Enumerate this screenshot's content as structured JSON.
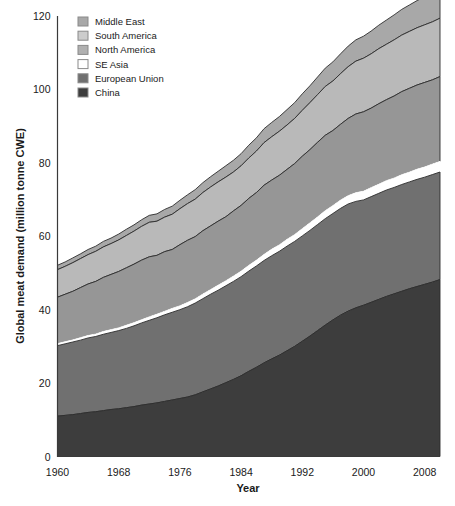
{
  "chart_data": {
    "type": "area",
    "stacked": true,
    "title": "",
    "xlabel": "Year",
    "ylabel": "Global meat demand (million tonne CWE)",
    "xlim": [
      1960,
      2010
    ],
    "ylim": [
      0,
      120
    ],
    "xticks": [
      1960,
      1968,
      1976,
      1984,
      1992,
      2000,
      2008
    ],
    "yticks": [
      0,
      20,
      40,
      60,
      80,
      100,
      120
    ],
    "grid": false,
    "legend_position": "top-left",
    "x": [
      1960,
      1961,
      1962,
      1963,
      1964,
      1965,
      1966,
      1967,
      1968,
      1969,
      1970,
      1971,
      1972,
      1973,
      1974,
      1975,
      1976,
      1977,
      1978,
      1979,
      1980,
      1981,
      1982,
      1983,
      1984,
      1985,
      1986,
      1987,
      1988,
      1989,
      1990,
      1991,
      1992,
      1993,
      1994,
      1995,
      1996,
      1997,
      1998,
      1999,
      2000,
      2001,
      2002,
      2003,
      2004,
      2005,
      2006,
      2007,
      2008,
      2009,
      2010
    ],
    "series": [
      {
        "name": "China",
        "color": "#3d3d3d",
        "values": [
          11.0,
          11.2,
          11.4,
          11.7,
          12.0,
          12.2,
          12.5,
          12.8,
          13.0,
          13.3,
          13.6,
          14.0,
          14.3,
          14.6,
          15.0,
          15.4,
          15.8,
          16.2,
          16.8,
          17.6,
          18.4,
          19.2,
          20.1,
          21.0,
          22.0,
          23.2,
          24.3,
          25.5,
          26.6,
          27.6,
          28.8,
          30.0,
          31.4,
          32.8,
          34.3,
          35.8,
          37.2,
          38.5,
          39.6,
          40.5,
          41.2,
          42.0,
          42.8,
          43.6,
          44.3,
          45.0,
          45.7,
          46.3,
          46.9,
          47.5,
          48.2
        ]
      },
      {
        "name": "European Union",
        "color": "#707070",
        "values": [
          19.2,
          19.5,
          19.8,
          20.0,
          20.3,
          20.5,
          20.8,
          21.0,
          21.3,
          21.6,
          22.0,
          22.4,
          22.8,
          23.2,
          23.6,
          23.9,
          24.2,
          24.6,
          25.0,
          25.4,
          25.8,
          26.1,
          26.4,
          26.7,
          27.0,
          27.3,
          27.6,
          27.9,
          28.1,
          28.3,
          28.5,
          28.6,
          28.7,
          28.8,
          28.9,
          29.0,
          29.0,
          29.1,
          29.2,
          29.0,
          28.7,
          28.8,
          28.9,
          29.0,
          29.0,
          29.1,
          29.1,
          29.2,
          29.2,
          29.3,
          29.3
        ]
      },
      {
        "name": "SE Asia",
        "color": "#ffffff",
        "values": [
          0.6,
          0.6,
          0.6,
          0.7,
          0.7,
          0.7,
          0.8,
          0.8,
          0.8,
          0.9,
          0.9,
          0.9,
          1.0,
          1.0,
          1.0,
          1.1,
          1.1,
          1.2,
          1.2,
          1.3,
          1.3,
          1.4,
          1.4,
          1.5,
          1.5,
          1.6,
          1.6,
          1.7,
          1.8,
          1.8,
          1.9,
          1.9,
          2.0,
          2.1,
          2.1,
          2.2,
          2.2,
          2.3,
          2.3,
          2.4,
          2.4,
          2.5,
          2.5,
          2.6,
          2.6,
          2.7,
          2.7,
          2.8,
          2.8,
          2.9,
          2.9
        ]
      },
      {
        "name": "North America",
        "color": "#969696",
        "values": [
          12.6,
          12.9,
          13.2,
          13.6,
          14.0,
          14.3,
          14.7,
          15.0,
          15.3,
          15.6,
          15.9,
          16.2,
          16.3,
          16.0,
          16.2,
          16.0,
          16.6,
          16.9,
          16.9,
          17.2,
          17.3,
          17.4,
          17.4,
          17.7,
          17.9,
          18.2,
          18.4,
          18.8,
          18.8,
          18.9,
          19.0,
          19.3,
          19.7,
          19.9,
          20.3,
          20.5,
          20.4,
          20.6,
          21.0,
          21.4,
          21.6,
          21.6,
          21.9,
          22.0,
          22.3,
          22.6,
          22.8,
          22.9,
          23.0,
          22.9,
          23.1
        ]
      },
      {
        "name": "South America",
        "color": "#b9b9b9",
        "values": [
          7.5,
          7.6,
          7.8,
          7.9,
          8.0,
          8.2,
          8.3,
          8.4,
          8.6,
          8.8,
          9.0,
          9.2,
          9.4,
          9.3,
          9.4,
          9.6,
          9.8,
          10.0,
          10.2,
          10.4,
          10.6,
          10.7,
          10.8,
          10.6,
          10.8,
          11.0,
          11.3,
          11.6,
          11.8,
          12.0,
          12.1,
          12.3,
          12.5,
          12.8,
          13.0,
          13.3,
          13.5,
          13.8,
          14.1,
          14.4,
          14.6,
          14.8,
          15.0,
          15.1,
          15.3,
          15.4,
          15.5,
          15.6,
          15.7,
          15.8,
          15.9
        ]
      },
      {
        "name": "Middle East",
        "color": "#a8a8a8",
        "values": [
          1.2,
          1.2,
          1.3,
          1.3,
          1.4,
          1.4,
          1.5,
          1.5,
          1.6,
          1.7,
          1.7,
          1.8,
          1.9,
          2.0,
          2.1,
          2.2,
          2.3,
          2.4,
          2.6,
          2.7,
          2.8,
          2.9,
          3.1,
          3.2,
          3.3,
          3.5,
          3.6,
          3.8,
          3.9,
          4.0,
          4.2,
          4.3,
          4.5,
          4.6,
          4.8,
          5.0,
          5.2,
          5.4,
          5.6,
          5.8,
          6.0,
          6.2,
          6.4,
          6.6,
          6.8,
          7.0,
          7.2,
          7.4,
          7.6,
          7.8,
          8.0
        ]
      }
    ],
    "legend_entries": [
      {
        "label": "Middle East",
        "color": "#a8a8a8"
      },
      {
        "label": "South America",
        "color": "#cccccc"
      },
      {
        "label": "North America",
        "color": "#b0b0b0"
      },
      {
        "label": "SE Asia",
        "color": "#ffffff"
      },
      {
        "label": "European Union",
        "color": "#707070"
      },
      {
        "label": "China",
        "color": "#3d3d3d"
      }
    ]
  }
}
